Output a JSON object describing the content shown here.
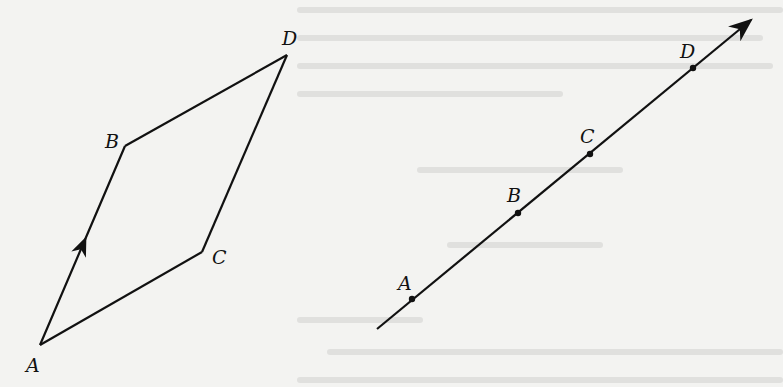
{
  "figure_left": {
    "description": "Parallelogram ABDC with arrows on AB and CD",
    "points": {
      "A": {
        "label": "A",
        "x": 40,
        "y": 345,
        "lx": 26,
        "ly": 372
      },
      "B": {
        "label": "B",
        "x": 125,
        "y": 146,
        "lx": 105,
        "ly": 148
      },
      "C": {
        "label": "C",
        "x": 202,
        "y": 252,
        "lx": 212,
        "ly": 264
      },
      "D": {
        "label": "D",
        "x": 287,
        "y": 55,
        "lx": 282,
        "ly": 45
      }
    },
    "edges": [
      [
        "A",
        "B"
      ],
      [
        "B",
        "D"
      ],
      [
        "D",
        "C"
      ],
      [
        "C",
        "A"
      ]
    ],
    "arrow_edges": [
      [
        "A",
        "B"
      ],
      [
        "C",
        "D"
      ]
    ]
  },
  "figure_right": {
    "description": "Collinear points A, B, C, D on a directed line",
    "line": {
      "x1": 377,
      "y1": 329,
      "x2": 751,
      "y2": 20
    },
    "points": {
      "A": {
        "label": "A",
        "x": 412,
        "y": 299,
        "lx": 398,
        "ly": 290
      },
      "B": {
        "label": "B",
        "x": 518,
        "y": 213,
        "lx": 507,
        "ly": 202
      },
      "C": {
        "label": "C",
        "x": 590,
        "y": 154,
        "lx": 580,
        "ly": 143
      },
      "D": {
        "label": "D",
        "x": 693,
        "y": 68,
        "lx": 680,
        "ly": 58
      }
    }
  },
  "colors": {
    "ink": "#111111",
    "paper": "#f3f3f1"
  }
}
